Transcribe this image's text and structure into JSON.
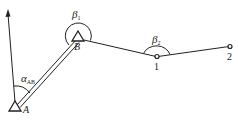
{
  "diagram": {
    "type": "traverse-survey",
    "points": {
      "A": {
        "label": "A",
        "kind": "known-control-point"
      },
      "B": {
        "label": "B",
        "kind": "known-control-point"
      },
      "p1": {
        "label": "1",
        "kind": "traverse-point"
      },
      "p2": {
        "label": "2",
        "kind": "traverse-point"
      }
    },
    "angles": {
      "alpha_ab": {
        "symbol": "α",
        "subscript": "AB"
      },
      "beta1": {
        "symbol": "β",
        "subscript": "1"
      },
      "beta2": {
        "symbol": "β",
        "subscript": "2"
      }
    },
    "north_arrow": {
      "icon": "north-arrow-icon"
    }
  }
}
